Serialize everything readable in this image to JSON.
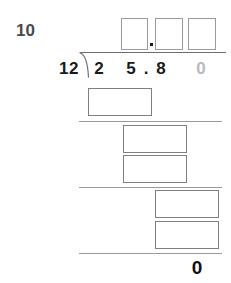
{
  "worksheet": {
    "problem_number": "10",
    "operation": "long-division"
  },
  "division": {
    "divisor": "12",
    "dividend_digits": [
      {
        "value": "2",
        "faded": false
      },
      {
        "value": "5",
        "faded": false
      },
      {
        "value": ".",
        "faded": false
      },
      {
        "value": "8",
        "faded": false
      },
      {
        "value": "0",
        "faded": true
      }
    ],
    "dividend_text": "25.80",
    "final_answer": "0"
  },
  "quotient": {
    "decimal_point": ".",
    "boxes": [
      {
        "name": "quotient-digit-1",
        "value": ""
      },
      {
        "name": "quotient-digit-2",
        "value": ""
      },
      {
        "name": "quotient-digit-3",
        "value": ""
      }
    ]
  },
  "work_boxes": [
    {
      "name": "work-box-1",
      "value": ""
    },
    {
      "name": "work-box-2",
      "value": ""
    },
    {
      "name": "work-box-3",
      "value": ""
    },
    {
      "name": "work-box-4",
      "value": ""
    },
    {
      "name": "work-box-5",
      "value": ""
    }
  ],
  "colors": {
    "ink": "#1a1a1a",
    "faded_ink": "#b9b9b9",
    "label": "#4a4a4a",
    "rule": "#9a9a9a",
    "box_border": "#8d8d8d",
    "page": "#ffffff"
  }
}
